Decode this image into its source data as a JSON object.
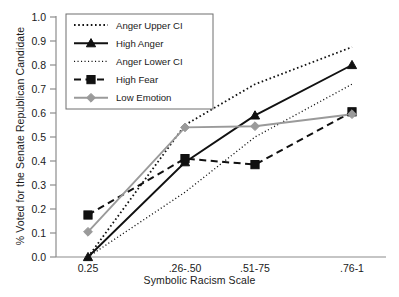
{
  "chart_data": {
    "type": "line",
    "title": "",
    "xlabel": "Symbolic Racism Scale",
    "ylabel": "% Voted for the Senate Republican Candidate",
    "categories": [
      "0.25",
      ".26-.50",
      ".51-75",
      ".76-1"
    ],
    "ylim": [
      0.0,
      1.0
    ],
    "yticks": [
      "0.0",
      "0.1",
      "0.2",
      "0.3",
      "0.4",
      "0.5",
      "0.6",
      "0.7",
      "0.8",
      "0.9",
      "1.0"
    ],
    "ytick_values": [
      0.0,
      0.1,
      0.2,
      0.3,
      0.4,
      0.5,
      0.6,
      0.7,
      0.8,
      0.9,
      1.0
    ],
    "grid": false,
    "legend_position": "top-left-inside",
    "series": [
      {
        "name": "Anger Upper CI",
        "values": [
          0.0,
          0.55,
          0.72,
          0.875
        ],
        "style": "dotted",
        "marker": "none",
        "color": "#111111"
      },
      {
        "name": "High Anger",
        "values": [
          0.0,
          0.395,
          0.59,
          0.8
        ],
        "style": "solid",
        "marker": "triangle",
        "color": "#111111"
      },
      {
        "name": "Anger Lower CI",
        "values": [
          0.0,
          0.27,
          0.5,
          0.72
        ],
        "style": "fine-dotted",
        "marker": "none",
        "color": "#111111"
      },
      {
        "name": "High Fear",
        "values": [
          0.175,
          0.41,
          0.385,
          0.605
        ],
        "style": "dashed",
        "marker": "square",
        "color": "#111111"
      },
      {
        "name": "Low Emotion",
        "values": [
          0.105,
          0.54,
          0.545,
          0.595
        ],
        "style": "solid",
        "marker": "diamond",
        "color": "#9a9a9a"
      }
    ]
  }
}
